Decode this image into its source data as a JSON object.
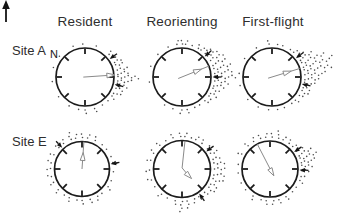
{
  "figure": {
    "columns": [
      "Resident",
      "Reorienting",
      "First-flight"
    ],
    "rows": [
      "Site A",
      "Site E"
    ],
    "north_label": "N"
  },
  "colors": {
    "background": "#ffffff",
    "ring": "#1c1c1c",
    "tick": "#1c1c1c",
    "dot": "#4d4d4d",
    "mean_vector": "#8a8a8a",
    "home_arrow": "#141414",
    "text": "#2e2e2e"
  },
  "chart_data": {
    "type": "scatter",
    "subtype": "circular-orientation-diagram",
    "legend_position": "none",
    "grid": false,
    "panels": [
      {
        "site": "Site A",
        "condition": "Resident",
        "cx": 85,
        "cy": 77,
        "r": 29,
        "mean_vector": {
          "direction_deg": 86,
          "length_fraction": 0.86,
          "path_polar": [
            [
              86,
              -0.06
            ],
            [
              86,
              1.0
            ]
          ],
          "head": {
            "angle_deg": 86,
            "at": [
              86,
              0.86
            ]
          }
        },
        "home_arrows_deg": [
          54,
          104
        ],
        "bearings": [
          [
            358,
            1
          ],
          [
            20,
            1
          ],
          [
            45,
            2
          ],
          [
            55,
            2
          ],
          [
            63,
            3
          ],
          [
            70,
            3
          ],
          [
            78,
            4
          ],
          [
            84,
            4
          ],
          [
            90,
            7
          ],
          [
            96,
            5
          ],
          [
            103,
            4
          ],
          [
            110,
            3
          ],
          [
            118,
            3
          ],
          [
            126,
            2
          ],
          [
            135,
            1
          ],
          [
            150,
            1
          ],
          [
            163,
            2
          ],
          [
            178,
            2
          ],
          [
            192,
            1
          ],
          [
            208,
            1
          ],
          [
            235,
            1
          ],
          [
            262,
            1
          ],
          [
            285,
            1
          ],
          [
            310,
            1
          ],
          [
            338,
            1
          ]
        ]
      },
      {
        "site": "Site A",
        "condition": "Reorienting",
        "cx": 182,
        "cy": 77,
        "r": 29,
        "mean_vector": {
          "direction_deg": 68,
          "length_fraction": 0.55,
          "path_polar": [
            [
              68,
              -0.14
            ],
            [
              68,
              1.0
            ]
          ],
          "head": {
            "angle_deg": 68,
            "at": [
              68,
              0.55
            ]
          }
        },
        "home_arrows_deg": [
          48,
          90
        ],
        "bearings": [
          [
            352,
            2
          ],
          [
            0,
            2
          ],
          [
            8,
            2
          ],
          [
            18,
            1
          ],
          [
            28,
            2
          ],
          [
            36,
            2
          ],
          [
            44,
            3
          ],
          [
            52,
            4
          ],
          [
            60,
            5
          ],
          [
            68,
            5
          ],
          [
            76,
            6
          ],
          [
            83,
            6
          ],
          [
            90,
            7
          ],
          [
            97,
            5
          ],
          [
            104,
            4
          ],
          [
            111,
            3
          ],
          [
            119,
            3
          ],
          [
            127,
            2
          ],
          [
            136,
            2
          ],
          [
            146,
            1
          ],
          [
            158,
            1
          ],
          [
            170,
            2
          ],
          [
            182,
            2
          ],
          [
            196,
            1
          ],
          [
            210,
            1
          ],
          [
            262,
            1
          ],
          [
            288,
            1
          ],
          [
            315,
            1
          ],
          [
            335,
            1
          ]
        ]
      },
      {
        "site": "Site A",
        "condition": "First-flight",
        "cx": 272,
        "cy": 77,
        "r": 29,
        "mean_vector": {
          "direction_deg": 73,
          "length_fraction": 0.52,
          "path_polar": [
            [
              73,
              -0.14
            ],
            [
              73,
              1.0
            ]
          ],
          "head": {
            "angle_deg": 73,
            "at": [
              73,
              0.52
            ]
          }
        },
        "home_arrows_deg": [
          52,
          103
        ],
        "bearings": [
          [
            355,
            2
          ],
          [
            8,
            1
          ],
          [
            20,
            1
          ],
          [
            33,
            1
          ],
          [
            43,
            2
          ],
          [
            51,
            3
          ],
          [
            58,
            5
          ],
          [
            65,
            8
          ],
          [
            72,
            10
          ],
          [
            79,
            9
          ],
          [
            86,
            7
          ],
          [
            93,
            5
          ],
          [
            100,
            4
          ],
          [
            108,
            3
          ],
          [
            116,
            3
          ],
          [
            124,
            2
          ],
          [
            133,
            2
          ],
          [
            144,
            1
          ],
          [
            157,
            1
          ],
          [
            172,
            1
          ],
          [
            186,
            1
          ],
          [
            203,
            1
          ],
          [
            228,
            1
          ],
          [
            254,
            1
          ],
          [
            278,
            1
          ],
          [
            304,
            1
          ],
          [
            330,
            1
          ]
        ]
      },
      {
        "site": "Site E",
        "condition": "Resident",
        "cx": 82,
        "cy": 169,
        "r": 27.5,
        "mean_vector": {
          "direction_deg": 4,
          "length_fraction": 0.42,
          "path_polar": [
            [
              4,
              0.0
            ],
            [
              4,
              1.0
            ]
          ],
          "head": {
            "angle_deg": 4,
            "at": [
              4,
              0.42
            ]
          }
        },
        "home_arrows_deg": [
          317,
          80
        ],
        "bearings": [
          [
            0,
            2
          ],
          [
            12,
            2
          ],
          [
            25,
            2
          ],
          [
            38,
            1
          ],
          [
            52,
            1
          ],
          [
            66,
            1
          ],
          [
            80,
            2
          ],
          [
            95,
            1
          ],
          [
            110,
            1
          ],
          [
            125,
            2
          ],
          [
            140,
            1
          ],
          [
            152,
            2
          ],
          [
            165,
            2
          ],
          [
            178,
            2
          ],
          [
            190,
            1
          ],
          [
            203,
            2
          ],
          [
            216,
            1
          ],
          [
            229,
            2
          ],
          [
            243,
            2
          ],
          [
            257,
            2
          ],
          [
            270,
            2
          ],
          [
            283,
            2
          ],
          [
            297,
            2
          ],
          [
            311,
            2
          ],
          [
            325,
            2
          ],
          [
            339,
            3
          ],
          [
            350,
            2
          ]
        ]
      },
      {
        "site": "Site E",
        "condition": "Reorienting",
        "cx": 182,
        "cy": 169,
        "r": 28.5,
        "mean_vector": {
          "direction_deg": 135,
          "length_fraction": 0.3,
          "path_polar": [
            [
              6,
              1.0
            ],
            [
              6,
              0.04
            ],
            [
              135,
              0.3
            ]
          ],
          "head": {
            "angle_deg": 135,
            "at": [
              135,
              0.3
            ]
          }
        },
        "home_arrows_deg": [
          54,
          145
        ],
        "bearings": [
          [
            356,
            2
          ],
          [
            6,
            2
          ],
          [
            16,
            1
          ],
          [
            27,
            2
          ],
          [
            38,
            2
          ],
          [
            50,
            2
          ],
          [
            62,
            3
          ],
          [
            72,
            3
          ],
          [
            81,
            4
          ],
          [
            90,
            4
          ],
          [
            99,
            4
          ],
          [
            108,
            4
          ],
          [
            117,
            3
          ],
          [
            126,
            3
          ],
          [
            136,
            2
          ],
          [
            147,
            2
          ],
          [
            158,
            2
          ],
          [
            170,
            3
          ],
          [
            181,
            4
          ],
          [
            192,
            2
          ],
          [
            205,
            1
          ],
          [
            220,
            2
          ],
          [
            236,
            1
          ],
          [
            252,
            2
          ],
          [
            268,
            2
          ],
          [
            284,
            2
          ],
          [
            300,
            2
          ],
          [
            316,
            2
          ],
          [
            332,
            1
          ],
          [
            344,
            2
          ]
        ]
      },
      {
        "site": "Site E",
        "condition": "First-flight",
        "cx": 270,
        "cy": 169,
        "r": 28,
        "mean_vector": {
          "direction_deg": 150,
          "length_fraction": 0.1,
          "path_polar": [
            [
              333,
              1.0
            ],
            [
              150,
              0.1
            ]
          ],
          "head": {
            "angle_deg": 150,
            "at": [
              150,
              0.1
            ]
          }
        },
        "home_arrows_deg": [
          55,
          92
        ],
        "bearings": [
          [
            354,
            2
          ],
          [
            4,
            2
          ],
          [
            14,
            3
          ],
          [
            25,
            2
          ],
          [
            36,
            2
          ],
          [
            47,
            2
          ],
          [
            56,
            3
          ],
          [
            64,
            5
          ],
          [
            71,
            6
          ],
          [
            78,
            5
          ],
          [
            85,
            4
          ],
          [
            93,
            3
          ],
          [
            102,
            2
          ],
          [
            112,
            2
          ],
          [
            124,
            1
          ],
          [
            137,
            1
          ],
          [
            150,
            2
          ],
          [
            162,
            2
          ],
          [
            174,
            2
          ],
          [
            186,
            2
          ],
          [
            198,
            1
          ],
          [
            212,
            2
          ],
          [
            228,
            1
          ],
          [
            245,
            1
          ],
          [
            262,
            1
          ],
          [
            280,
            1
          ],
          [
            298,
            2
          ],
          [
            315,
            2
          ],
          [
            330,
            2
          ],
          [
            342,
            2
          ]
        ]
      }
    ]
  }
}
